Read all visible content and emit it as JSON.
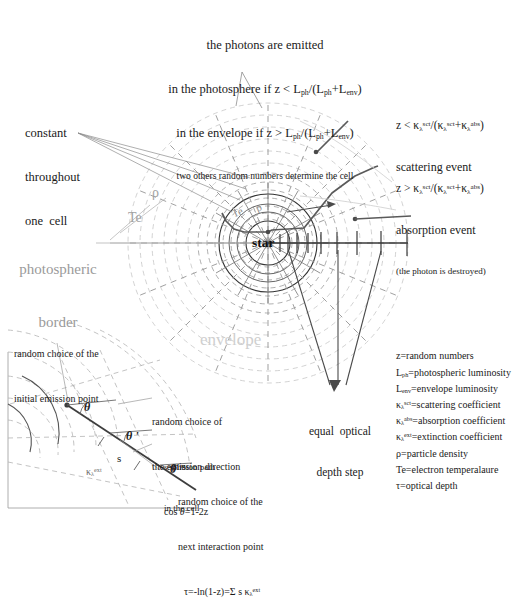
{
  "figure": {
    "title_top": {
      "line1": "the photons are emitted",
      "line2_pre": "in the photosphere if z < L",
      "line2_sub1": "ph",
      "line2_mid": "/(L",
      "line2_sub2": "ph",
      "line2_plus": "+L",
      "line2_sub3": "env",
      "line2_end": ")",
      "line3_pre": "in the envelope if z > L",
      "line3_sub1": "ph",
      "line3_mid": "/(L",
      "line3_sub2": "ph",
      "line3_plus": "+L",
      "line3_sub3": "env",
      "line3_end": ")",
      "line4": "two others random numbers determine the cell"
    },
    "scattering": {
      "formula_pre": "z < ",
      "k1": "κ",
      "sub1": "λ",
      "sup1": "sct",
      "slash": "/(",
      "k2": "κ",
      "sub2": "λ",
      "sup2": "sct",
      "plus": "+",
      "k3": "κ",
      "sub3": "λ",
      "sup3": "abs",
      "close": ")",
      "label": "scattering event"
    },
    "absorption": {
      "formula_pre": "z > ",
      "k1": "κ",
      "sub1": "λ",
      "sup1": "sct",
      "slash": "/(",
      "k2": "κ",
      "sub2": "λ",
      "sup2": "sct",
      "plus": "+",
      "k3": "κ",
      "sub3": "λ",
      "sup3": "abs",
      "close": ")",
      "label": "absorption event",
      "note": "(the photon is destroyed)"
    },
    "constant_cell": {
      "line1": "constant",
      "line2": "throughout",
      "line3": "one  cell"
    },
    "photospheric_border": {
      "line1": "photospheric",
      "line2": "border"
    },
    "center_label": "star",
    "envelope_label": "envelope",
    "rho_label": "ρ",
    "te_label": "Te",
    "rho_label_inner": "ρ",
    "te_label_inner": "Te",
    "equal_depth": {
      "line1": "equal  optical",
      "line2": "depth step"
    }
  },
  "legend": {
    "items": [
      {
        "sym": "z",
        "sub": "",
        "sup": "",
        "def": "=random numbers"
      },
      {
        "sym": "L",
        "sub": "ph",
        "sup": "",
        "def": "=photospheric luminosity"
      },
      {
        "sym": "L",
        "sub": "env",
        "sup": "",
        "def": "=envelope luminosity"
      },
      {
        "sym": "κ",
        "sub": "λ",
        "sup": "sct",
        "def": "=scattering coefficient"
      },
      {
        "sym": "κ",
        "sub": "λ",
        "sup": "abs",
        "def": "=absorption coefficient"
      },
      {
        "sym": "κ",
        "sub": "λ",
        "sup": "ext",
        "def": "=extinction coefficient"
      },
      {
        "sym": "ρ",
        "sub": "",
        "sup": "",
        "def": "=particle density"
      },
      {
        "sym": "Te",
        "sub": "",
        "sup": "",
        "def": "=electron temperalaure"
      },
      {
        "sym": "τ",
        "sub": "",
        "sup": "",
        "def": "=optical depth"
      }
    ]
  },
  "inset": {
    "initial_point": {
      "line1": "random choice of the",
      "line2": "initial emission point"
    },
    "emission_dir": {
      "line1": "random choice of",
      "line2": "the emission direction",
      "line3_pre": "cos ",
      "line3_theta": "θ",
      "line3_post": "=1-2z"
    },
    "photon_path": {
      "line1": "s=photon path",
      "line2": "in the cell"
    },
    "next_point": {
      "line1": "random choice of the",
      "line2": "next interaction point",
      "formula_pre": "τ=-ln(1-z)=Σ s ",
      "formula_k": "κ",
      "formula_sub": "λ",
      "formula_sup": "ext"
    },
    "theta": "θ",
    "theta_prime": "θ '",
    "theta_dprime": "θ \"",
    "s_label": "s",
    "kappa_sym": "κ",
    "kappa_sub": "λ",
    "kappa_sup": "ext"
  },
  "colors": {
    "ink": "#1a1a1a",
    "dashed_circle": "#a9a9a9",
    "spoke": "#8c8c8c",
    "path": "#4d4d4d",
    "faint": "#cfcfcf",
    "label_gray": "#9a9a9a",
    "label_vgray": "#cccccc"
  }
}
